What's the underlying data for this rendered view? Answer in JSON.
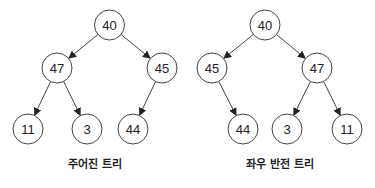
{
  "diagram": {
    "node_radius": 15,
    "colors": {
      "stroke": "#444444",
      "text": "#222222",
      "background": "#ffffff"
    },
    "trees": [
      {
        "caption": "주어진 트리",
        "caption_pos": [
          95,
          168
        ],
        "nodes": [
          {
            "id": "n40",
            "label": "40",
            "x": 109.5,
            "y": 25
          },
          {
            "id": "n47",
            "label": "47",
            "x": 57,
            "y": 68
          },
          {
            "id": "n45",
            "label": "45",
            "x": 162,
            "y": 68
          },
          {
            "id": "n11",
            "label": "11",
            "x": 28,
            "y": 129
          },
          {
            "id": "n3",
            "label": "3",
            "x": 87,
            "y": 129
          },
          {
            "id": "n44",
            "label": "44",
            "x": 133,
            "y": 129
          }
        ],
        "edges": [
          {
            "from": "n40",
            "to": "n47"
          },
          {
            "from": "n40",
            "to": "n45"
          },
          {
            "from": "n47",
            "to": "n11"
          },
          {
            "from": "n47",
            "to": "n3"
          },
          {
            "from": "n45",
            "to": "n44"
          }
        ]
      },
      {
        "caption": "좌우 반전 트리",
        "caption_pos": [
          280,
          168
        ],
        "nodes": [
          {
            "id": "m40",
            "label": "40",
            "x": 265,
            "y": 25
          },
          {
            "id": "m45",
            "label": "45",
            "x": 212,
            "y": 68
          },
          {
            "id": "m47",
            "label": "47",
            "x": 317,
            "y": 68
          },
          {
            "id": "m44",
            "label": "44",
            "x": 243,
            "y": 129
          },
          {
            "id": "m3",
            "label": "3",
            "x": 287,
            "y": 129
          },
          {
            "id": "m11",
            "label": "11",
            "x": 347,
            "y": 129
          }
        ],
        "edges": [
          {
            "from": "m40",
            "to": "m45"
          },
          {
            "from": "m40",
            "to": "m47"
          },
          {
            "from": "m45",
            "to": "m44"
          },
          {
            "from": "m47",
            "to": "m3"
          },
          {
            "from": "m47",
            "to": "m11"
          }
        ]
      }
    ]
  }
}
